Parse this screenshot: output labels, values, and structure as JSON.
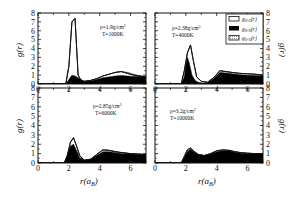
{
  "chart_data": [
    {
      "type": "area",
      "panel": "top-left",
      "annotation": [
        "ρ=1.9g/cm³",
        "T=1000K"
      ],
      "xlabel": "r(a_B)",
      "ylabel": "g(r)",
      "xlim": [
        0,
        7
      ],
      "ylim": [
        0,
        8
      ],
      "xticks": [
        0,
        2,
        4,
        6
      ],
      "yticks": [
        0,
        1,
        2,
        3,
        4,
        5,
        6,
        7,
        8
      ],
      "series": [
        {
          "name": "g_H-O(r)",
          "style": "open",
          "x": [
            0,
            1.8,
            2.0,
            2.2,
            2.4,
            2.6,
            2.8,
            3.0,
            3.4,
            3.8,
            4.2,
            4.6,
            5.0,
            5.4,
            5.8,
            6.2,
            6.6,
            7.0
          ],
          "y": [
            0,
            0,
            2.0,
            7.0,
            7.4,
            1.0,
            0.4,
            0.3,
            0.4,
            0.6,
            0.9,
            1.1,
            1.3,
            1.4,
            1.2,
            1.0,
            0.9,
            0.8
          ]
        },
        {
          "name": "g_H-H(r)",
          "style": "filled-black",
          "x": [
            0,
            1.8,
            2.0,
            2.2,
            2.4,
            2.6,
            2.8,
            3.0,
            3.4,
            3.8,
            4.2,
            4.6,
            5.0,
            5.4,
            5.8,
            6.2,
            6.6,
            7.0
          ],
          "y": [
            0,
            0,
            0.5,
            1.0,
            0.9,
            0.7,
            0.5,
            0.3,
            0.35,
            0.5,
            0.7,
            0.8,
            0.9,
            0.95,
            0.9,
            0.85,
            0.85,
            0.85
          ]
        },
        {
          "name": "g_O-O(r)",
          "style": "dotted",
          "x": [
            0,
            3.8,
            4.2,
            4.6,
            5.0,
            5.4,
            5.8,
            6.2,
            6.6,
            7.0
          ],
          "y": [
            0,
            0,
            0.3,
            0.9,
            1.3,
            1.4,
            1.3,
            1.1,
            0.9,
            0.8
          ]
        }
      ]
    },
    {
      "type": "area",
      "panel": "top-right",
      "annotation": [
        "ρ=2.38g/cm³",
        "T=4000K"
      ],
      "xlabel": "r(a_B)",
      "ylabel": "g(r)",
      "xlim": [
        0,
        7
      ],
      "ylim": [
        0,
        8
      ],
      "xticks": [
        0,
        2,
        4,
        6
      ],
      "yticks": [
        0,
        1,
        2,
        3,
        4,
        5,
        6,
        7,
        8
      ],
      "series": [
        {
          "name": "g_H-O(r)",
          "style": "open",
          "x": [
            0,
            1.7,
            1.9,
            2.1,
            2.3,
            2.5,
            2.7,
            3.0,
            3.4,
            3.8,
            4.2,
            4.6,
            5.0,
            5.5,
            6.0,
            6.5,
            7.0
          ],
          "y": [
            0,
            0,
            1.5,
            3.5,
            4.4,
            2.5,
            0.8,
            0.3,
            0.2,
            0.7,
            1.5,
            1.4,
            1.3,
            1.2,
            1.15,
            1.1,
            1.0
          ]
        },
        {
          "name": "g_H-H(r)",
          "style": "filled-black",
          "x": [
            0,
            1.7,
            1.9,
            2.0,
            2.1,
            2.2,
            2.4,
            2.6,
            2.8,
            3.0,
            3.4,
            3.8,
            4.2,
            4.6,
            5.0,
            5.5,
            6.0,
            6.5,
            7.0
          ],
          "y": [
            0,
            0,
            0.8,
            2.2,
            3.0,
            2.5,
            1.0,
            0.4,
            0.2,
            0.1,
            0.15,
            0.6,
            1.3,
            1.25,
            1.15,
            1.05,
            1.0,
            0.95,
            0.9
          ]
        },
        {
          "name": "g_O-O(r)",
          "style": "dotted",
          "x": [
            0,
            3.5,
            3.8,
            4.2,
            4.6,
            5.0,
            5.5,
            6.0,
            6.5,
            7.0
          ],
          "y": [
            0,
            0,
            0.6,
            1.3,
            1.2,
            1.1,
            1.0,
            0.95,
            0.9,
            0.9
          ]
        }
      ],
      "legend": {
        "position": "upper-right",
        "entries": [
          {
            "label": "g_H-O(r)",
            "swatch": "open"
          },
          {
            "label": "g_H-H(r)",
            "swatch": "filled-black"
          },
          {
            "label": "g_O-O(r)",
            "swatch": "dotted"
          }
        ]
      }
    },
    {
      "type": "area",
      "panel": "bottom-left",
      "annotation": [
        "ρ=2.85g/cm³",
        "T=6000K"
      ],
      "xlabel": "r(a_B)",
      "ylabel": "g(r)",
      "xlim": [
        0,
        7
      ],
      "ylim": [
        0,
        8
      ],
      "xticks": [
        0,
        2,
        4,
        6
      ],
      "yticks": [
        0,
        1,
        2,
        3,
        4,
        5,
        6,
        7,
        8
      ],
      "series": [
        {
          "name": "g_H-O(r)",
          "style": "open",
          "x": [
            0,
            1.7,
            1.9,
            2.1,
            2.3,
            2.5,
            2.7,
            3.0,
            3.4,
            3.8,
            4.2,
            4.6,
            5.0,
            5.5,
            6.0,
            6.5,
            7.0
          ],
          "y": [
            0,
            0,
            0.8,
            2.2,
            2.7,
            1.8,
            0.8,
            0.3,
            0.4,
            0.9,
            1.4,
            1.35,
            1.2,
            1.1,
            1.0,
            0.95,
            0.9
          ]
        },
        {
          "name": "g_H-H(r)",
          "style": "filled-black",
          "x": [
            0,
            1.7,
            1.9,
            2.1,
            2.3,
            2.5,
            2.7,
            3.0,
            3.4,
            3.8,
            4.2,
            4.6,
            5.0,
            5.5,
            6.0,
            6.5,
            7.0
          ],
          "y": [
            0,
            0,
            0.8,
            1.8,
            2.0,
            1.3,
            0.6,
            0.3,
            0.4,
            0.8,
            1.2,
            1.2,
            1.1,
            1.0,
            0.95,
            0.9,
            0.9
          ]
        },
        {
          "name": "g_O-O(r)",
          "style": "dotted",
          "x": [
            0,
            3.2,
            3.6,
            4.0,
            4.4,
            4.8,
            5.2,
            5.6,
            6.0,
            6.5,
            7.0
          ],
          "y": [
            0,
            0,
            0.5,
            1.1,
            1.35,
            1.3,
            1.15,
            1.05,
            1.0,
            0.95,
            0.9
          ]
        }
      ]
    },
    {
      "type": "area",
      "panel": "bottom-right",
      "annotation": [
        "ρ=3.2g/cm³",
        "T=10000K"
      ],
      "xlabel": "r(a_B)",
      "ylabel": "g(r)",
      "xlim": [
        0,
        7
      ],
      "ylim": [
        0,
        8
      ],
      "xticks": [
        0,
        2,
        4,
        6
      ],
      "yticks": [
        0,
        1,
        2,
        3,
        4,
        5,
        6,
        7,
        8
      ],
      "series": [
        {
          "name": "g_H-O(r)",
          "style": "open",
          "x": [
            0,
            1.7,
            1.9,
            2.1,
            2.3,
            2.5,
            2.8,
            3.2,
            3.6,
            4.0,
            4.4,
            4.8,
            5.2,
            5.6,
            6.0,
            6.5,
            7.0
          ],
          "y": [
            0,
            0,
            0.7,
            1.4,
            1.6,
            1.3,
            0.9,
            0.8,
            1.0,
            1.3,
            1.4,
            1.35,
            1.2,
            1.1,
            1.05,
            1.0,
            1.0
          ]
        },
        {
          "name": "g_H-H(r)",
          "style": "filled-black",
          "x": [
            0,
            1.7,
            1.9,
            2.1,
            2.3,
            2.5,
            2.8,
            3.2,
            3.6,
            4.0,
            4.4,
            4.8,
            5.2,
            5.6,
            6.0,
            6.5,
            7.0
          ],
          "y": [
            0,
            0,
            0.6,
            1.2,
            1.5,
            1.2,
            0.9,
            0.8,
            0.95,
            1.2,
            1.3,
            1.3,
            1.15,
            1.05,
            1.0,
            1.0,
            1.0
          ]
        },
        {
          "name": "g_O-O(r)",
          "style": "dotted",
          "x": [
            0,
            2.8,
            3.2,
            3.6,
            4.0,
            4.4,
            4.8,
            5.2,
            5.6,
            6.0,
            6.5,
            7.0
          ],
          "y": [
            0,
            0,
            0.4,
            0.8,
            1.1,
            1.2,
            1.15,
            1.05,
            1.0,
            1.0,
            0.95,
            0.95
          ]
        }
      ]
    }
  ],
  "labels": {
    "ylabel": "g(r)",
    "xlabel_main": "r(a",
    "xlabel_sub": "B",
    "xlabel_close": ")",
    "xtick": [
      "0",
      "2",
      "4",
      "6"
    ],
    "ytick": [
      "0",
      "1",
      "2",
      "3",
      "4",
      "5",
      "6",
      "7",
      "8"
    ],
    "legend": [
      {
        "main": "g",
        "sub": "H-O",
        "tail": "(r)"
      },
      {
        "main": "g",
        "sub": "H-H",
        "tail": "(r)"
      },
      {
        "main": "g",
        "sub": "O-O",
        "tail": "(r)"
      }
    ],
    "annotations": {
      "tl": {
        "rho": "ρ=1.9g/cm",
        "sup": "3",
        "T": "T=1000K"
      },
      "tr": {
        "rho": "ρ=2.38g/cm",
        "sup": "3",
        "T": "T=4000K"
      },
      "bl": {
        "rho": "ρ=2.85g/cm",
        "sup": "3",
        "T": "T=6000K"
      },
      "br": {
        "rho": "ρ=3.2g/cm",
        "sup": "3",
        "T": "T=10000K"
      }
    }
  },
  "colors": {
    "frame": "#111111",
    "hh_fill": "#000000",
    "oo_fill": "#cfcfcf",
    "background": "#ffffff"
  }
}
